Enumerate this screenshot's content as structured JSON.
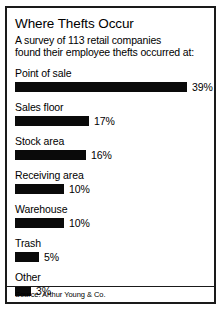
{
  "chart_data": {
    "type": "bar",
    "title": "Where Thefts Occur",
    "subtitle_lines": [
      "A survey of 113 retail companies",
      "found their employee thefts occurred at:"
    ],
    "orientation": "horizontal",
    "categories": [
      "Point of sale",
      "Sales floor",
      "Stock area",
      "Receiving  area",
      "Warehouse",
      "Trash",
      "Other"
    ],
    "values": [
      39,
      17,
      16,
      10,
      10,
      5,
      3
    ],
    "value_labels": [
      "39%",
      "17%",
      "16%",
      "10%",
      "10%",
      "5%",
      "3%"
    ],
    "xlabel": "",
    "ylabel": "",
    "xlim": [
      0,
      39
    ],
    "grid": false,
    "legend": false,
    "bar_color": "#0a0a0a",
    "background_color": "#ffffff",
    "source": "Source: Arthur Young & Co.",
    "bar_pixel_widths": [
      172,
      74,
      71,
      49,
      49,
      24,
      16
    ]
  }
}
